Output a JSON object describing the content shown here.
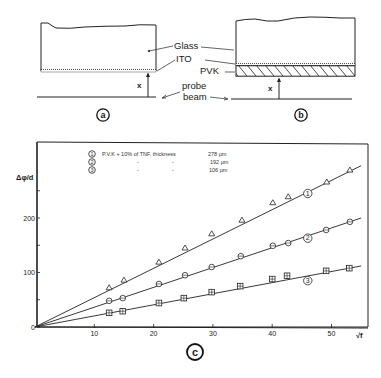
{
  "diagram_a": {
    "panel_label": "a",
    "labels": {
      "glass": "Glass",
      "ito": "ITO",
      "pvk": "PVK",
      "probe": "probe",
      "beam": "beam",
      "distance": "x"
    }
  },
  "diagram_b": {
    "panel_label": "b",
    "distance": "x"
  },
  "chart_panel_label": "c",
  "chart_data": {
    "type": "scatter",
    "title": "",
    "xlabel": "√f",
    "ylabel": "Δφ/d",
    "xlim": [
      0,
      56
    ],
    "ylim": [
      0,
      330
    ],
    "x_ticks": [
      10,
      20,
      30,
      40,
      50
    ],
    "x_tick_labels": [
      "10",
      "20",
      "30",
      "40",
      "50"
    ],
    "y_ticks": [
      0,
      50,
      100,
      150,
      200,
      250
    ],
    "y_tick_labels": [
      "0",
      "",
      "100",
      "",
      "200",
      ""
    ],
    "grid": false,
    "legend_position": "upper-left",
    "legend_title": "PVK + 10% of TNF, thickness",
    "series": [
      {
        "id": "1",
        "name": "PVK + 10% of TNF, thickness 278 µm",
        "thickness": "278 µm",
        "marker": "triangle",
        "fit_line": [
          [
            0,
            0
          ],
          [
            55,
            296
          ]
        ],
        "x": [
          12.5,
          15.0,
          20.9,
          25.3,
          29.8,
          34.9,
          40.1,
          42.7,
          49.2,
          53.1
        ],
        "y": [
          72,
          86,
          119,
          145,
          171,
          196,
          228,
          239,
          266,
          288
        ]
      },
      {
        "id": "2",
        "name": "PVK + 10% of TNF, thickness 192 µm",
        "thickness": "192 µm",
        "marker": "circle",
        "fit_line": [
          [
            0,
            0
          ],
          [
            55,
            200
          ]
        ],
        "x": [
          12.5,
          14.8,
          20.9,
          25.3,
          29.8,
          34.7,
          40.1,
          42.7,
          49.1,
          53.1
        ],
        "y": [
          48,
          53,
          79,
          95,
          110,
          130,
          149,
          154,
          178,
          193
        ]
      },
      {
        "id": "3",
        "name": "PVK + 10% of TNF, thickness 106 µm",
        "thickness": "106 µm",
        "marker": "square-cross",
        "fit_line": [
          [
            0,
            0
          ],
          [
            55,
            112
          ]
        ],
        "x": [
          12.5,
          14.8,
          20.9,
          25.1,
          29.8,
          34.6,
          40.0,
          42.5,
          49.1,
          53.0
        ],
        "y": [
          26,
          29,
          44,
          53,
          64,
          75,
          88,
          94,
          103,
          108
        ]
      }
    ],
    "curve_labels": [
      {
        "id": "1",
        "x": 46,
        "y": 245
      },
      {
        "id": "2",
        "x": 46,
        "y": 163
      },
      {
        "id": "3",
        "x": 46,
        "y": 85
      }
    ]
  },
  "legend": {
    "rows": [
      {
        "num": "1",
        "text": "P.V.K + 10% of TNF, thickness",
        "dash1": "",
        "dash2": "",
        "value": "278 µm"
      },
      {
        "num": "2",
        "text": "",
        "dash1": "-",
        "dash2": "-",
        "value": "192 µm"
      },
      {
        "num": "3",
        "text": "",
        "dash1": "-",
        "dash2": "-",
        "value": "106 µm"
      }
    ]
  }
}
